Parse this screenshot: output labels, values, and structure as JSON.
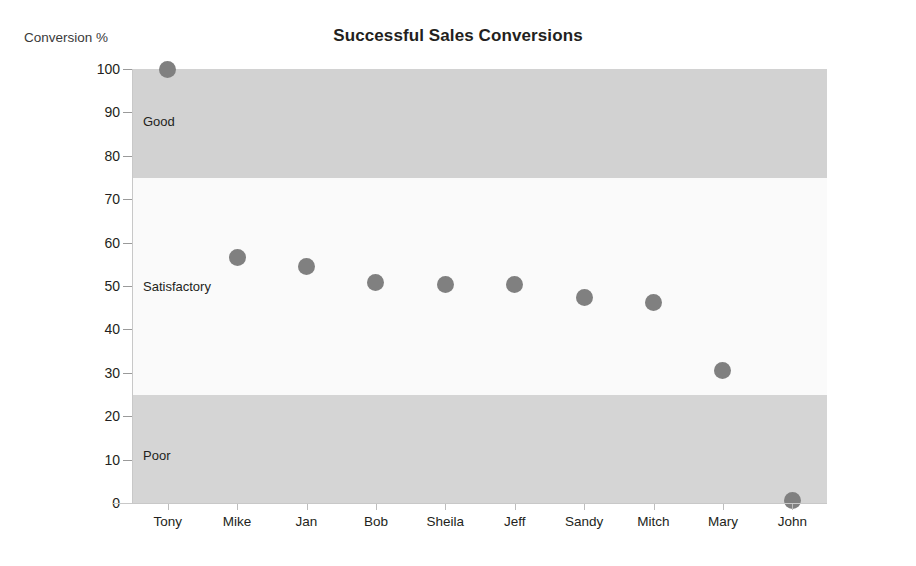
{
  "chart_data": {
    "type": "scatter",
    "title": "Successful Sales Conversions",
    "xlabel": "",
    "ylabel": "Conversion %",
    "ylim": [
      0,
      100
    ],
    "ytick_step": 10,
    "yticks": [
      100,
      90,
      80,
      70,
      60,
      50,
      40,
      30,
      20,
      10,
      0
    ],
    "grid": false,
    "legend": "none",
    "categories": [
      "Tony",
      "Mike",
      "Jan",
      "Bob",
      "Sheila",
      "Jeff",
      "Sandy",
      "Mitch",
      "Mary",
      "John"
    ],
    "values": [
      100,
      56.5,
      54.5,
      50.8,
      50.4,
      50.4,
      47.3,
      46.2,
      30.6,
      0.5
    ],
    "series": [
      {
        "name": "Conversion %",
        "marker": "circle",
        "color": "#808080",
        "values": [
          100,
          56.5,
          54.5,
          50.8,
          50.4,
          50.4,
          47.3,
          46.2,
          30.6,
          0.5
        ]
      }
    ],
    "bands": [
      {
        "label": "Good",
        "from": 75,
        "to": 100,
        "color": "#d2d2d2",
        "label_at": 88
      },
      {
        "label": "Satisfactory",
        "from": 25,
        "to": 75,
        "color": "#fafafa",
        "label_at": 50
      },
      {
        "label": "Poor",
        "from": 0,
        "to": 25,
        "color": "#d5d5d5",
        "label_at": 11
      }
    ]
  },
  "colors": {
    "marker": "#808080",
    "axis": "#c8c8c8",
    "text": "#231f20",
    "band_good": "#d2d2d2",
    "band_satisfactory": "#fafafa",
    "band_poor": "#d5d5d5",
    "background": "#ffffff"
  }
}
